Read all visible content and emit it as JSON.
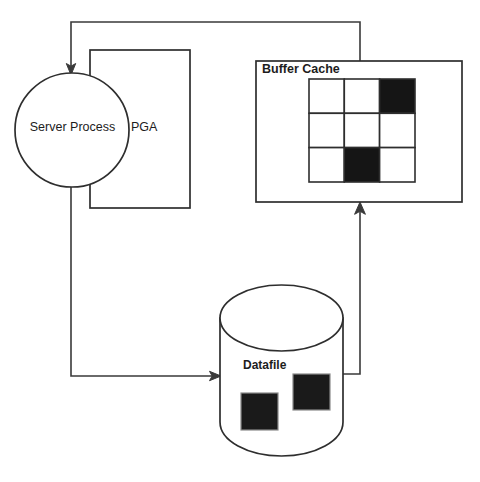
{
  "diagram": {
    "nodes": {
      "server_process": {
        "label": "Server Process",
        "shape": "circle"
      },
      "pga": {
        "label": "PGA",
        "shape": "rectangle"
      },
      "buffer_cache": {
        "label": "Buffer Cache",
        "shape": "rectangle",
        "grid": {
          "rows": 3,
          "cols": 3,
          "filled_cells": [
            [
              0,
              2
            ],
            [
              2,
              1
            ]
          ],
          "cell_states": [
            [
              "empty",
              "empty",
              "filled"
            ],
            [
              "empty",
              "empty",
              "empty"
            ],
            [
              "empty",
              "filled",
              "empty"
            ]
          ]
        }
      },
      "datafile": {
        "label": "Datafile",
        "shape": "cylinder",
        "blocks": 2
      }
    },
    "connectors": [
      {
        "name": "buffer-cache-to-server-process",
        "from": "buffer_cache",
        "to": "server_process",
        "arrow": "down-into-server-process"
      },
      {
        "name": "server-process-to-datafile",
        "from": "server_process",
        "to": "datafile",
        "arrow": "right-into-datafile"
      },
      {
        "name": "datafile-to-buffer-cache",
        "from": "datafile",
        "to": "buffer_cache",
        "arrow": "up-into-buffer-cache"
      }
    ],
    "colors": {
      "stroke": "#2e2e2e",
      "filled_block": "#1a1a1a",
      "background": "#ffffff"
    }
  }
}
